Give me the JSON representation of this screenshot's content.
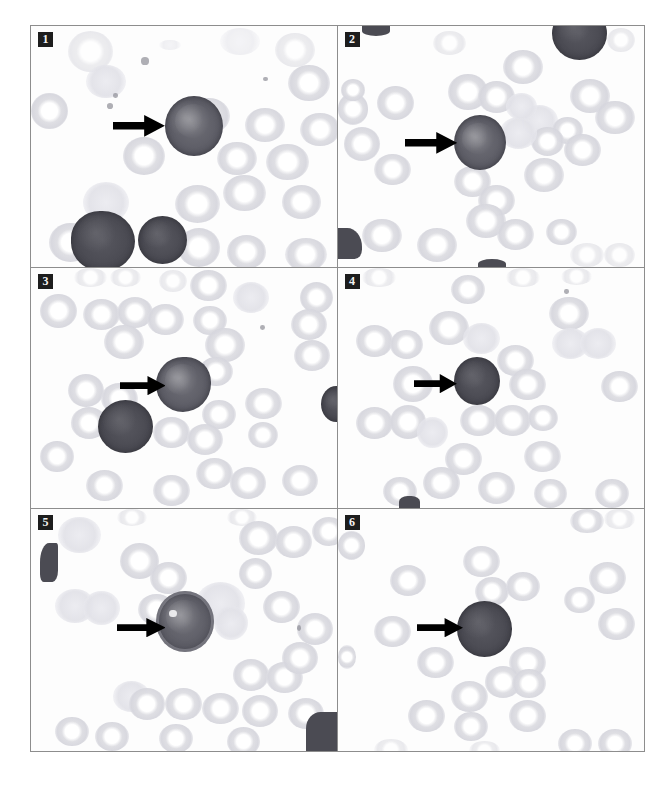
{
  "figure": {
    "panel_count": 6,
    "background_color": "#ffffff",
    "frame_color": "#8d8d8d",
    "label_background": "#1d1d1d",
    "label_text_color": "#f2f2f2",
    "arrow_color": "#000000",
    "nucleated_cell_color": "#5d5d66",
    "erythrocyte_color": "#d8d8de"
  },
  "panels": [
    {
      "label": "1",
      "name": "panel-1",
      "arrow": {
        "name": "pointer-arrow-1",
        "direction": "right"
      },
      "target_cell": {
        "name": "arrowed-cell-1",
        "description": "large dark mononuclear cell"
      },
      "other_dark_cells": 2
    },
    {
      "label": "2",
      "name": "panel-2",
      "arrow": {
        "name": "pointer-arrow-2",
        "direction": "right"
      },
      "target_cell": {
        "name": "arrowed-cell-2",
        "description": "dark mononuclear cell with pale nucleolus"
      },
      "other_dark_cells": 2
    },
    {
      "label": "3",
      "name": "panel-3",
      "arrow": {
        "name": "pointer-arrow-3",
        "direction": "right"
      },
      "target_cell": {
        "name": "arrowed-cell-3",
        "description": "large lobulated dark cell"
      },
      "other_dark_cells": 2
    },
    {
      "label": "4",
      "name": "panel-4",
      "arrow": {
        "name": "pointer-arrow-4",
        "direction": "right"
      },
      "target_cell": {
        "name": "arrowed-cell-4",
        "description": "small dark mononuclear cell"
      },
      "other_dark_cells": 1
    },
    {
      "label": "5",
      "name": "panel-5",
      "arrow": {
        "name": "pointer-arrow-5",
        "direction": "right"
      },
      "target_cell": {
        "name": "arrowed-cell-5",
        "description": "large dark cell with pale cytoplasmic rim and vacuole"
      },
      "other_dark_cells": 2
    },
    {
      "label": "6",
      "name": "panel-6",
      "arrow": {
        "name": "pointer-arrow-6",
        "direction": "right"
      },
      "target_cell": {
        "name": "arrowed-cell-6",
        "description": "round uniformly dark cell"
      },
      "other_dark_cells": 0
    }
  ]
}
